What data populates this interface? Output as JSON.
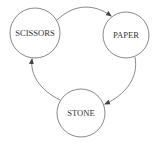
{
  "diagram": {
    "type": "cycle",
    "nodes": [
      {
        "id": "scissors",
        "label": "SCISSORS",
        "cx": 35,
        "cy": 33,
        "r": 25
      },
      {
        "id": "paper",
        "label": "PAPER",
        "cx": 126,
        "cy": 35,
        "r": 23
      },
      {
        "id": "stone",
        "label": "STONE",
        "cx": 81,
        "cy": 113,
        "r": 24
      }
    ],
    "edges": [
      {
        "from": "scissors",
        "to": "paper"
      },
      {
        "from": "paper",
        "to": "stone"
      },
      {
        "from": "stone",
        "to": "scissors"
      }
    ],
    "colors": {
      "stroke": "#6a6a6a",
      "text": "#333333",
      "background": "#ffffff"
    }
  }
}
